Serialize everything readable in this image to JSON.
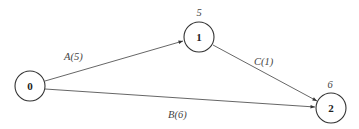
{
  "diagram": {
    "type": "network-graph",
    "nodes": [
      {
        "id": "0",
        "label": "0",
        "time": ""
      },
      {
        "id": "1",
        "label": "1",
        "time": "5"
      },
      {
        "id": "2",
        "label": "2",
        "time": "6"
      }
    ],
    "edges": [
      {
        "from": "0",
        "to": "1",
        "label": "A(5)"
      },
      {
        "from": "0",
        "to": "2",
        "label": "B(6)"
      },
      {
        "from": "1",
        "to": "2",
        "label": "C(1)"
      }
    ],
    "colors": {
      "node_stroke": "#333333",
      "edge": "#555555",
      "text": "#444444"
    }
  }
}
